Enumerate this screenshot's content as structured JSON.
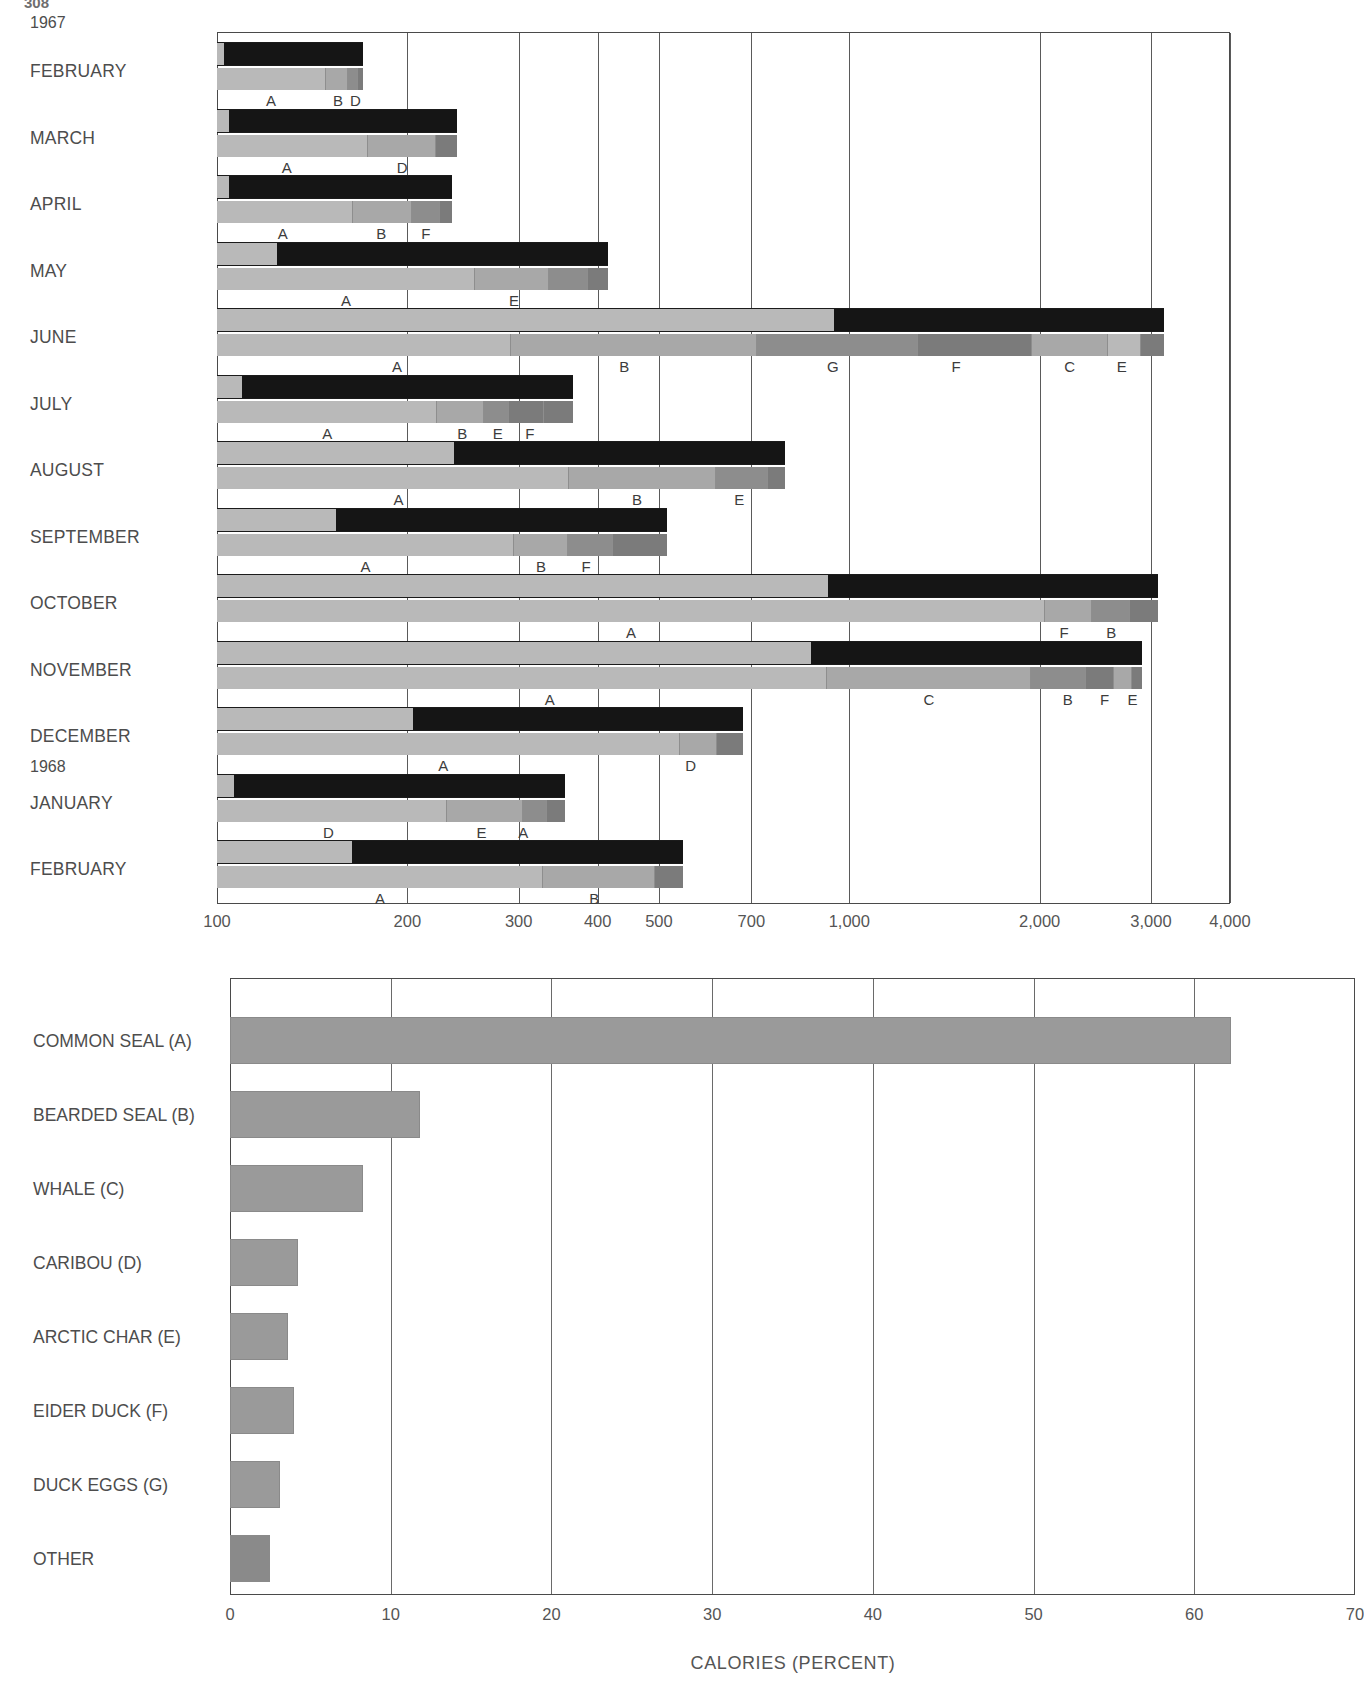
{
  "page_number": "308",
  "chart_data": [
    {
      "type": "bar",
      "id": "monthly-caloric-intake",
      "title": "",
      "xlabel": "THOUSANDS OF KILOCALORIES",
      "ylabel": "",
      "scale": "log",
      "xticks": [
        100,
        200,
        300,
        400,
        500,
        700,
        1000,
        2000,
        3000,
        4000
      ],
      "xtick_labels": [
        "100",
        "200",
        "300",
        "400",
        "500",
        "700",
        "1,000",
        "2,000",
        "3,000",
        "4,000"
      ],
      "xlim": [
        100,
        4000
      ],
      "grid": true,
      "year_markers": [
        {
          "label": "1967",
          "row": 0
        },
        {
          "label": "1968",
          "row": 11
        }
      ],
      "categories": [
        "FEBRUARY",
        "MARCH",
        "APRIL",
        "MAY",
        "JUNE",
        "JULY",
        "AUGUST",
        "SEPTEMBER",
        "OCTOBER",
        "NOVEMBER",
        "DECEMBER",
        "JANUARY",
        "FEBRUARY"
      ],
      "total_kilocalories": [
        170,
        240,
        235,
        415,
        3150,
        365,
        790,
        515,
        3080,
        2900,
        680,
        355,
        545
      ],
      "rows": [
        {
          "month": "FEBRUARY",
          "total": 170,
          "composition_breaks": [
            {
              "code": "A",
              "cum_pct": 75.0
            },
            {
              "code": "B",
              "cum_pct": 90.0
            },
            {
              "code": "D",
              "cum_pct": 97.0
            }
          ],
          "labels": [
            {
              "code": "A",
              "pct_pos": 37.0
            },
            {
              "code": "B",
              "pct_pos": 83.0
            },
            {
              "code": "D",
              "pct_pos": 95.0
            }
          ]
        },
        {
          "month": "MARCH",
          "total": 240,
          "composition_breaks": [
            {
              "code": "A",
              "cum_pct": 63.0
            },
            {
              "code": "D",
              "cum_pct": 91.0
            }
          ],
          "labels": [
            {
              "code": "A",
              "pct_pos": 29.0
            },
            {
              "code": "D",
              "pct_pos": 77.0
            }
          ]
        },
        {
          "month": "APRIL",
          "total": 235,
          "composition_breaks": [
            {
              "code": "A",
              "cum_pct": 58.0
            },
            {
              "code": "B",
              "cum_pct": 83.0
            },
            {
              "code": "F",
              "cum_pct": 95.0
            }
          ],
          "labels": [
            {
              "code": "A",
              "pct_pos": 28.0
            },
            {
              "code": "B",
              "pct_pos": 70.0
            },
            {
              "code": "F",
              "pct_pos": 89.0
            }
          ]
        },
        {
          "month": "MAY",
          "total": 415,
          "composition_breaks": [
            {
              "code": "A",
              "cum_pct": 66.0
            },
            {
              "code": "E",
              "cum_pct": 85.0
            },
            {
              "code": "O",
              "cum_pct": 95.0
            }
          ],
          "labels": [
            {
              "code": "A",
              "pct_pos": 33.0
            },
            {
              "code": "E",
              "pct_pos": 76.0
            }
          ]
        },
        {
          "month": "JUNE",
          "total": 3150,
          "composition_breaks": [
            {
              "code": "A",
              "cum_pct": 31.0
            },
            {
              "code": "B",
              "cum_pct": 57.0
            },
            {
              "code": "G",
              "cum_pct": 74.0
            },
            {
              "code": "F",
              "cum_pct": 86.0
            },
            {
              "code": "C",
              "cum_pct": 94.0
            },
            {
              "code": "E",
              "cum_pct": 97.5
            }
          ],
          "labels": [
            {
              "code": "A",
              "pct_pos": 19.0
            },
            {
              "code": "B",
              "pct_pos": 43.0
            },
            {
              "code": "G",
              "pct_pos": 65.0
            },
            {
              "code": "F",
              "pct_pos": 78.0
            },
            {
              "code": "C",
              "pct_pos": 90.0
            },
            {
              "code": "E",
              "pct_pos": 95.5
            }
          ]
        },
        {
          "month": "JULY",
          "total": 365,
          "composition_breaks": [
            {
              "code": "A",
              "cum_pct": 62.0
            },
            {
              "code": "B",
              "cum_pct": 75.0
            },
            {
              "code": "E",
              "cum_pct": 82.0
            },
            {
              "code": "F",
              "cum_pct": 92.0
            }
          ],
          "labels": [
            {
              "code": "A",
              "pct_pos": 31.0
            },
            {
              "code": "B",
              "pct_pos": 69.0
            },
            {
              "code": "E",
              "pct_pos": 79.0
            },
            {
              "code": "F",
              "pct_pos": 88.0
            }
          ]
        },
        {
          "month": "AUGUST",
          "total": 790,
          "composition_breaks": [
            {
              "code": "A",
              "cum_pct": 62.0
            },
            {
              "code": "B",
              "cum_pct": 88.0
            },
            {
              "code": "E",
              "cum_pct": 97.0
            }
          ],
          "labels": [
            {
              "code": "A",
              "pct_pos": 32.0
            },
            {
              "code": "B",
              "pct_pos": 74.0
            },
            {
              "code": "E",
              "pct_pos": 92.0
            }
          ]
        },
        {
          "month": "SEPTEMBER",
          "total": 515,
          "composition_breaks": [
            {
              "code": "A",
              "cum_pct": 66.0
            },
            {
              "code": "B",
              "cum_pct": 78.0
            },
            {
              "code": "F",
              "cum_pct": 88.0
            }
          ],
          "labels": [
            {
              "code": "A",
              "pct_pos": 33.0
            },
            {
              "code": "B",
              "pct_pos": 72.0
            },
            {
              "code": "F",
              "pct_pos": 82.0
            }
          ]
        },
        {
          "month": "OCTOBER",
          "total": 3080,
          "composition_breaks": [
            {
              "code": "A",
              "cum_pct": 88.0
            },
            {
              "code": "F",
              "cum_pct": 93.0
            },
            {
              "code": "B",
              "cum_pct": 97.0
            }
          ],
          "labels": [
            {
              "code": "A",
              "pct_pos": 44.0
            },
            {
              "code": "F",
              "pct_pos": 90.0
            },
            {
              "code": "B",
              "pct_pos": 95.0
            }
          ]
        },
        {
          "month": "NOVEMBER",
          "total": 2900,
          "composition_breaks": [
            {
              "code": "A",
              "cum_pct": 66.0
            },
            {
              "code": "C",
              "cum_pct": 88.0
            },
            {
              "code": "B",
              "cum_pct": 94.0
            },
            {
              "code": "F",
              "cum_pct": 97.0
            },
            {
              "code": "E",
              "cum_pct": 99.0
            }
          ],
          "labels": [
            {
              "code": "A",
              "pct_pos": 36.0
            },
            {
              "code": "C",
              "pct_pos": 77.0
            },
            {
              "code": "B",
              "pct_pos": 92.0
            },
            {
              "code": "F",
              "pct_pos": 96.0
            },
            {
              "code": "E",
              "pct_pos": 99.0
            }
          ]
        },
        {
          "month": "DECEMBER",
          "total": 680,
          "composition_breaks": [
            {
              "code": "A",
              "cum_pct": 88.0
            },
            {
              "code": "D",
              "cum_pct": 95.0
            }
          ],
          "labels": [
            {
              "code": "A",
              "pct_pos": 43.0
            },
            {
              "code": "D",
              "pct_pos": 90.0
            }
          ]
        },
        {
          "month": "JANUARY",
          "total": 355,
          "composition_breaks": [
            {
              "code": "D",
              "cum_pct": 66.0
            },
            {
              "code": "E",
              "cum_pct": 88.0
            },
            {
              "code": "A",
              "cum_pct": 95.0
            }
          ],
          "labels": [
            {
              "code": "D",
              "pct_pos": 32.0
            },
            {
              "code": "E",
              "pct_pos": 76.0
            },
            {
              "code": "A",
              "pct_pos": 88.0
            }
          ]
        },
        {
          "month": "FEBRUARY",
          "total": 545,
          "composition_breaks": [
            {
              "code": "A",
              "cum_pct": 70.0
            },
            {
              "code": "B",
              "cum_pct": 94.0
            }
          ],
          "labels": [
            {
              "code": "A",
              "pct_pos": 35.0
            },
            {
              "code": "B",
              "pct_pos": 81.0
            }
          ]
        }
      ]
    },
    {
      "type": "bar",
      "id": "annual-calorie-percent",
      "title": "",
      "xlabel": "CALORIES  (PERCENT)",
      "ylabel": "",
      "scale": "linear",
      "xlim": [
        0,
        70
      ],
      "xticks": [
        0,
        10,
        20,
        30,
        40,
        50,
        60,
        70
      ],
      "xtick_labels": [
        "0",
        "10",
        "20",
        "30",
        "40",
        "50",
        "60",
        "70"
      ],
      "grid": true,
      "categories": [
        "COMMON SEAL (A)",
        "BEARDED SEAL (B)",
        "WHALE (C)",
        "CARIBOU (D)",
        "ARCTIC CHAR (E)",
        "EIDER DUCK (F)",
        "DUCK EGGS (G)",
        "OTHER"
      ],
      "values": [
        62.3,
        11.8,
        8.3,
        4.2,
        3.6,
        4.0,
        3.1,
        2.5
      ]
    }
  ]
}
